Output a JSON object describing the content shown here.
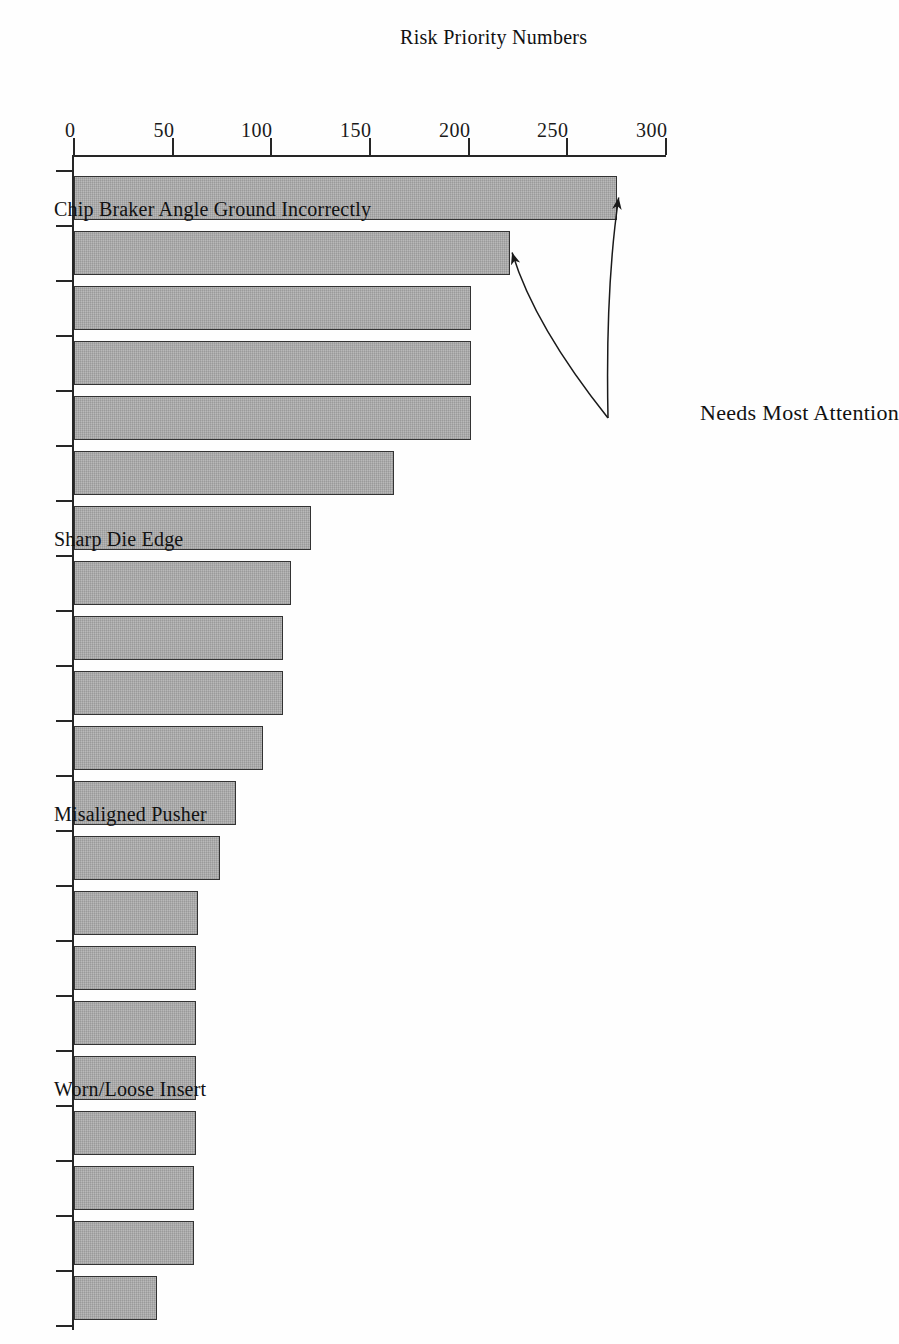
{
  "chart_data": {
    "type": "bar",
    "orientation": "vertical-bars-rendered-rotated",
    "title": "",
    "xlabel": "",
    "ylabel": "Risk Priority Numbers",
    "ylim": [
      0,
      300
    ],
    "yticks": [
      0,
      50,
      100,
      150,
      200,
      250,
      300
    ],
    "ytick_labels": [
      "0",
      "50",
      "100",
      "150",
      "200",
      "250",
      "300"
    ],
    "grid": false,
    "legend": null,
    "bar_color": "#a9a9a9",
    "bar_edge_color": "#333333",
    "categories": [
      "Chip Braker Angle Ground Incorrectly",
      "",
      "",
      "",
      "",
      "",
      "Sharp Die Edge",
      "",
      "",
      "",
      "",
      "Misaligned Pusher",
      "",
      "",
      "",
      "",
      "Worn/Loose Insert",
      "",
      "",
      "",
      ""
    ],
    "visible_category_labels": [
      {
        "index": 0,
        "label": "Chip Braker Angle Ground Incorrectly"
      },
      {
        "index": 6,
        "label": "Sharp Die Edge"
      },
      {
        "index": 11,
        "label": "Misaligned Pusher"
      },
      {
        "index": 16,
        "label": "Worn/Loose Insert"
      }
    ],
    "values": [
      275,
      221,
      201,
      201,
      201,
      162,
      120,
      110,
      106,
      106,
      96,
      82,
      74,
      63,
      62,
      62,
      62,
      62,
      61,
      61,
      42
    ],
    "annotations": [
      {
        "text": "Needs Most Attention",
        "points_to": [
          0,
          1
        ],
        "arrow_count": 2
      }
    ]
  },
  "axis": {
    "value_axis_title": "Risk Priority Numbers",
    "tick_labels": [
      "300",
      "250",
      "200",
      "150",
      "100",
      "50",
      "0"
    ]
  },
  "annotation": {
    "label": "Needs Most Attention"
  }
}
